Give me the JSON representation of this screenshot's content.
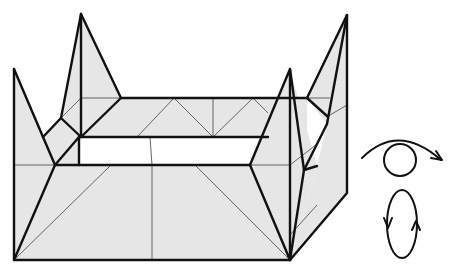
{
  "diagram": {
    "fill_color": "#e6e6e6",
    "line_color": "#111111",
    "crease_color": "#555555",
    "background": "#ffffff"
  },
  "symbols": [
    {
      "name": "turn-over-view-symbol",
      "description": "eye with curved arrow (change viewpoint)"
    },
    {
      "name": "rotate-symbol",
      "description": "vertical ellipse with two arrows (rotate/turn model)"
    }
  ]
}
